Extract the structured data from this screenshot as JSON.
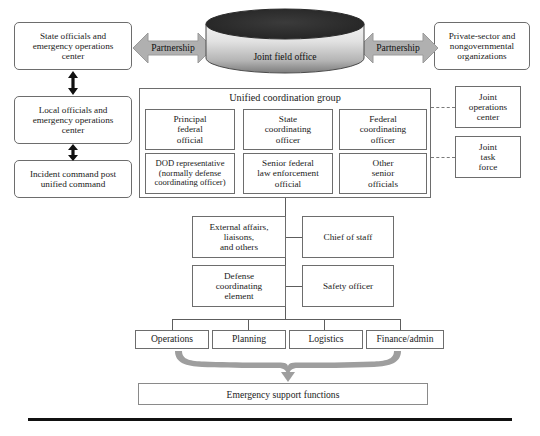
{
  "diagram": {
    "colors": {
      "arrow_gray": "#a8a8a8",
      "cylinder_top": "#2e2e2e",
      "cylinder_body_light": "#f0f0f0",
      "cylinder_body_dark": "#7c7c7c",
      "box_border": "#6d6d6d",
      "rule_black": "#111111"
    },
    "cylinder": {
      "label": "Joint field office"
    },
    "partnership": {
      "left_label": "Partnership",
      "right_label": "Partnership"
    },
    "left_column": [
      {
        "label": "State officials and\nemergency operations\ncenter"
      },
      {
        "label": "Local officials and\nemergency operations\ncenter"
      },
      {
        "label": "Incident command post\nunified command"
      }
    ],
    "right_column": [
      {
        "label": "Private-sector and\nnongovernmental\norganizations"
      },
      {
        "label": "Joint\noperations\ncenter"
      },
      {
        "label": "Joint\ntask\nforce"
      }
    ],
    "unified_coordination_group": {
      "title": "Unified  coordination  group",
      "members": [
        {
          "label": "Principal\nfederal\nofficial"
        },
        {
          "label": "State\ncoordinating\nofficer"
        },
        {
          "label": "Federal\ncoordinating\nofficer"
        },
        {
          "label": "DOD representative\n(normally defense\ncoordinating officer)"
        },
        {
          "label": "Senior federal\nlaw enforcement\nofficial"
        },
        {
          "label": "Other\nsenior\nofficials"
        }
      ]
    },
    "staff": [
      {
        "label": "External affairs,\nliaisons,\nand others"
      },
      {
        "label": "Chief of staff"
      },
      {
        "label": "Defense\ncoordinating\nelement"
      },
      {
        "label": "Safety officer"
      }
    ],
    "sections": [
      {
        "label": "Operations"
      },
      {
        "label": "Planning"
      },
      {
        "label": "Logistics"
      },
      {
        "label": "Finance/admin"
      }
    ],
    "emergency_support": {
      "label": "Emergency support functions"
    }
  }
}
